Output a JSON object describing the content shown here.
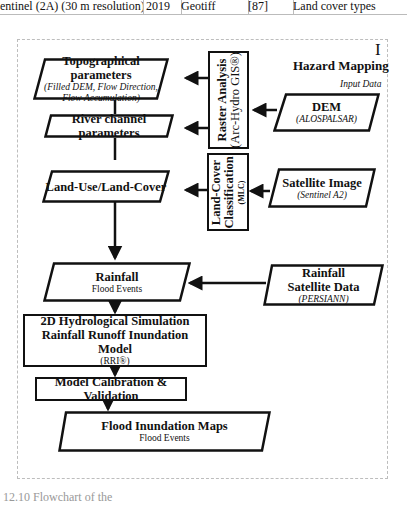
{
  "table_fragment": {
    "cells": [
      "entinel (2A) (30 m resolution)",
      "2019",
      "Geotiff",
      "[87]",
      "Land cover types"
    ]
  },
  "diagram": {
    "panel_id": "I",
    "panel_title": "Hazard Mapping",
    "input_data_label": "Input Data",
    "nodes": {
      "topo": {
        "title": "Topographical parameters",
        "sub1": "(Filled DEM, Flow Direction,",
        "sub2": "Flow Accumulation)"
      },
      "river": {
        "title": "River channel parameters"
      },
      "lulc": {
        "title": "Land-Use/Land-Cover"
      },
      "raster": {
        "title": "Raster Analysis",
        "sub": "(Arc-Hydro GIS®)"
      },
      "dem": {
        "title": "DEM",
        "sub": "(ALOSPALSAR)"
      },
      "lcc": {
        "title1": "Land-Cover",
        "title2": "Classification",
        "sub": "(MLC)"
      },
      "sat": {
        "title": "Satellite Image",
        "sub": "(Sentinel A2)"
      },
      "rain": {
        "title": "Rainfall",
        "sub": "Flood Events"
      },
      "rainsat": {
        "title1": "Rainfall",
        "title2": "Satellite Data",
        "sub": "(PERSIANN)"
      },
      "hydro": {
        "title1": "2D Hydrological Simulation",
        "title2": "Rainfall Runoff Inundation Model",
        "sub": "(RRI®)"
      },
      "calib": {
        "title": "Model Calibration & Validation"
      },
      "maps": {
        "title": "Flood Inundation Maps",
        "sub": "Flood Events"
      }
    },
    "colors": {
      "stroke": "#111111",
      "frame": "#bdbdbd",
      "background": "#ffffff"
    }
  },
  "caption": "12.10  Flowchart of the"
}
